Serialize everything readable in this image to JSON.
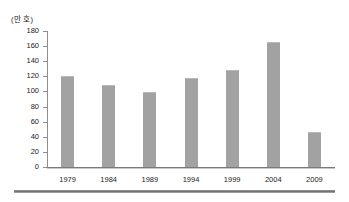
{
  "figure": {
    "unit_label": "(만 호)",
    "bottom_rule": "horizontal-rule"
  },
  "chart_data": {
    "type": "bar",
    "title": "",
    "subtitle": "",
    "xlabel": "",
    "ylabel": "(만 호)",
    "categories": [
      "1979",
      "1984",
      "1989",
      "1994",
      "1999",
      "2004",
      "2009"
    ],
    "values": [
      120,
      109,
      99,
      118,
      129,
      166,
      46
    ],
    "series": [
      {
        "name": "",
        "values": [
          120,
          109,
          99,
          118,
          129,
          166,
          46
        ]
      }
    ],
    "ylim": [
      0,
      180
    ],
    "ytick_step": 20,
    "ytick_labels": [
      "180",
      "160",
      "140",
      "120",
      "100",
      "80",
      "60",
      "40",
      "20",
      "0"
    ],
    "ytick_values": [
      180,
      160,
      140,
      120,
      100,
      80,
      60,
      40,
      20,
      0
    ],
    "grid": false,
    "legend": null,
    "legend_position": "none",
    "bar_color": "#a2a2a2",
    "axis_color": "#8e8e8e",
    "annotations": []
  }
}
